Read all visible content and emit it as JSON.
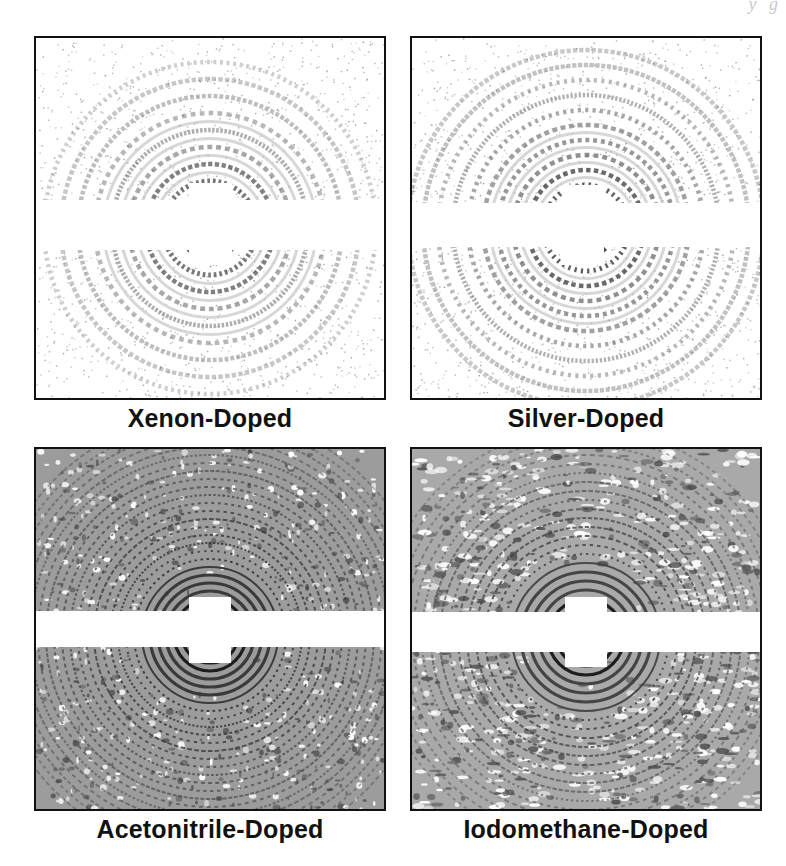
{
  "figure": {
    "page_bleed_text": "y g",
    "panels": [
      {
        "id": "xenon",
        "caption": "Xenon-Doped",
        "pattern": {
          "style": "sparse-speckle-rings",
          "ring_count": 9,
          "ring_spacing": 17,
          "inner_radius": 30,
          "density": 0.45,
          "tone": "#555555",
          "center": [
            174,
            190
          ]
        },
        "beamstop": {
          "bar_y": 162,
          "bar_h": 50,
          "square_x": 153,
          "square_y": 145,
          "square_w": 43,
          "square_h": 82
        }
      },
      {
        "id": "silver",
        "caption": "Silver-Doped",
        "pattern": {
          "style": "sparse-speckle-rings",
          "ring_count": 11,
          "ring_spacing": 15,
          "inner_radius": 28,
          "density": 0.55,
          "tone": "#4a4a4a",
          "center": [
            174,
            190
          ]
        },
        "beamstop": {
          "bar_y": 165,
          "bar_h": 44,
          "square_x": 150,
          "square_y": 147,
          "square_w": 42,
          "square_h": 80
        }
      },
      {
        "id": "acetonitrile",
        "caption": "Acetonitrile-Doped",
        "pattern": {
          "style": "dense-fine-rings",
          "ring_count": 26,
          "ring_spacing": 8,
          "inner_radius": 20,
          "density": 0.9,
          "tone": "#3a3a3a",
          "center": [
            174,
            186
          ]
        },
        "beamstop": {
          "bar_y": 162,
          "bar_h": 36,
          "square_x": 153,
          "square_y": 148,
          "square_w": 42,
          "square_h": 66
        }
      },
      {
        "id": "iodomethane",
        "caption": "Iodomethane-Doped",
        "pattern": {
          "style": "dense-mottled-rings",
          "ring_count": 22,
          "ring_spacing": 9,
          "inner_radius": 20,
          "density": 0.85,
          "tone": "#444444",
          "center": [
            174,
            188
          ]
        },
        "beamstop": {
          "bar_y": 163,
          "bar_h": 40,
          "square_x": 153,
          "square_y": 148,
          "square_w": 42,
          "square_h": 70
        }
      }
    ]
  }
}
